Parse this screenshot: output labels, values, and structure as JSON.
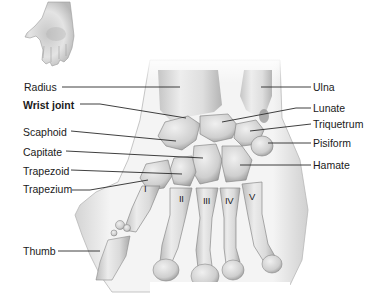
{
  "diagram": {
    "inset_icon": "open-hand-icon",
    "labels_left": [
      {
        "id": "radius",
        "text": "Radius",
        "x": 24,
        "y": 81,
        "bold": false
      },
      {
        "id": "wrist-joint",
        "text": "Wrist joint",
        "x": 23,
        "y": 99,
        "bold": true
      },
      {
        "id": "scaphoid",
        "text": "Scaphoid",
        "x": 23,
        "y": 126,
        "bold": false
      },
      {
        "id": "capitate",
        "text": "Capitate",
        "x": 23,
        "y": 146,
        "bold": false
      },
      {
        "id": "trapezoid",
        "text": "Trapezoid",
        "x": 23,
        "y": 165,
        "bold": false
      },
      {
        "id": "trapezium",
        "text": "Trapezium",
        "x": 23,
        "y": 183,
        "bold": false
      },
      {
        "id": "thumb",
        "text": "Thumb",
        "x": 23,
        "y": 245,
        "bold": false
      }
    ],
    "labels_right": [
      {
        "id": "ulna",
        "text": "Ulna",
        "x": 313,
        "y": 81,
        "bold": false
      },
      {
        "id": "lunate",
        "text": "Lunate",
        "x": 313,
        "y": 99,
        "bold": false
      },
      {
        "id": "triquetrum",
        "text": "Triquetrum",
        "x": 313,
        "y": 118,
        "bold": false
      },
      {
        "id": "pisiform",
        "text": "Pisiform",
        "x": 313,
        "y": 137,
        "bold": false
      },
      {
        "id": "hamate",
        "text": "Hamate",
        "x": 313,
        "y": 159,
        "bold": false
      }
    ],
    "metacarpal_numerals": [
      {
        "text": "I",
        "x": 144,
        "y": 184
      },
      {
        "text": "II",
        "x": 179,
        "y": 194
      },
      {
        "text": "III",
        "x": 203,
        "y": 196
      },
      {
        "text": "IV",
        "x": 225,
        "y": 196
      },
      {
        "text": "V",
        "x": 249,
        "y": 192
      }
    ],
    "leader_lines": [
      {
        "for": "radius",
        "points": "62,87 180,87"
      },
      {
        "for": "wrist-joint",
        "points": "80,104 100,104 186,118"
      },
      {
        "for": "scaphoid",
        "points": "71,131 176,141"
      },
      {
        "for": "capitate",
        "points": "66,151 203,158"
      },
      {
        "for": "trapezoid",
        "points": "71,170 182,174"
      },
      {
        "for": "trapezium",
        "points": "72,190 90,190 148,180"
      },
      {
        "for": "thumb",
        "points": "58,251 100,251"
      },
      {
        "for": "ulna",
        "points": "261,87 311,87"
      },
      {
        "for": "lunate",
        "points": "222,122 296,108 311,108"
      },
      {
        "for": "triquetrum",
        "points": "250,131 311,124"
      },
      {
        "for": "pisiform",
        "points": "268,143 311,143"
      },
      {
        "for": "hamate",
        "points": "240,165 311,165"
      }
    ],
    "colors": {
      "bone_fill": "#e2e2e2",
      "bone_shadow": "#a8a8a8",
      "skin": "#f2f2f2",
      "outline": "#7a7a7a",
      "text": "#1a1a1a",
      "leader": "#2a2a2a"
    }
  }
}
